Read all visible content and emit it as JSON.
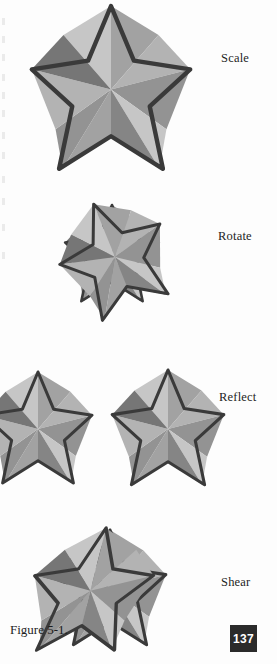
{
  "page": {
    "caption": "Figure 5-1.",
    "folio": "137",
    "background_color": "#fdfdfd",
    "ink_color": "#1d1d1d",
    "folio_background": "#2b2b2b",
    "folio_text_color": "#ffffff"
  },
  "figure": {
    "name": "star-transformations",
    "outline_color": "#3a3a3a",
    "ghost_outline_color": "#cfcfcf",
    "facets": {
      "light": "#c6c6c6",
      "mid_light": "#b3b3b3",
      "mid": "#a2a2a2",
      "mid_dark": "#939393",
      "dark": "#858585",
      "darkest": "#767676"
    },
    "pale_facets": {
      "light": "#fbfbfb",
      "mid_light": "#f4f4f4",
      "mid": "#ededed",
      "mid_dark": "#e6e6e6",
      "dark": "#dedede",
      "darkest": "#d6d6d6"
    },
    "rows": [
      {
        "id": "scale",
        "label": "Scale",
        "label_x": 221,
        "label_y": 51,
        "has_ghost": false,
        "note": "large star, top point cropped by page edge"
      },
      {
        "id": "rotate",
        "label": "Rotate",
        "label_x": 218,
        "label_y": 229,
        "has_ghost": true,
        "note": "pale original star with darker rotated copy on top"
      },
      {
        "id": "reflect",
        "label": "Reflect",
        "label_x": 219,
        "label_y": 390,
        "has_ghost": true,
        "note": "pale star at left, dark mirrored star at right"
      },
      {
        "id": "shear",
        "label": "Shear",
        "label_x": 221,
        "label_y": 575,
        "has_ghost": true,
        "note": "pale original with skewed copy on top, cropped at bottom"
      }
    ]
  }
}
